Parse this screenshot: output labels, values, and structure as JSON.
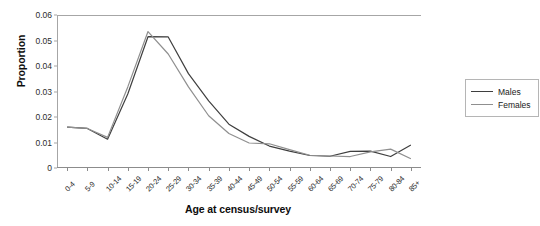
{
  "chart_data": {
    "type": "line",
    "title": "",
    "xlabel": "Age at census/survey",
    "ylabel": "Proportion",
    "categories": [
      "0-4",
      "5-9",
      "10-14",
      "15-19",
      "20-24",
      "25-29",
      "30-34",
      "35-39",
      "40-44",
      "45-49",
      "50-54",
      "55-59",
      "60-64",
      "65-69",
      "70-74",
      "75-79",
      "80-84",
      "85+"
    ],
    "ylim": [
      0,
      0.06
    ],
    "yticks": [
      "0",
      "0.01",
      "0.02",
      "0.03",
      "0.04",
      "0.05",
      "0.06"
    ],
    "ytick_values": [
      0,
      0.01,
      0.02,
      0.03,
      0.04,
      0.05,
      0.06
    ],
    "grid": false,
    "legend_position": "right",
    "series": [
      {
        "name": "Males",
        "color": "#3f3f3f",
        "values": [
          0.016,
          0.0155,
          0.0113,
          0.029,
          0.0515,
          0.0514,
          0.037,
          0.0263,
          0.0172,
          0.0124,
          0.0086,
          0.0066,
          0.0049,
          0.0046,
          0.0065,
          0.0066,
          0.0045,
          0.009
        ]
      },
      {
        "name": "Females",
        "color": "#8f8f8f",
        "values": [
          0.016,
          0.0155,
          0.012,
          0.0318,
          0.0535,
          0.0447,
          0.0318,
          0.0205,
          0.0135,
          0.0098,
          0.0095,
          0.0072,
          0.005,
          0.0047,
          0.0045,
          0.0063,
          0.0074,
          0.0036
        ]
      }
    ]
  },
  "legend": {
    "items": [
      {
        "label": "Males"
      },
      {
        "label": "Females"
      }
    ]
  },
  "axes": {
    "x_title": "Age at census/survey",
    "y_title": "Proportion"
  },
  "colors": {
    "males": "#3f3f3f",
    "females": "#8f8f8f",
    "axis": "#a6a6a6",
    "text": "#1a1a1a"
  }
}
